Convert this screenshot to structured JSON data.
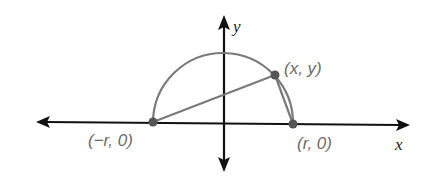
{
  "diagram": {
    "type": "semicircle-triangle",
    "axes": {
      "x_label": "x",
      "y_label": "y"
    },
    "points": [
      {
        "id": "left",
        "label": "(−r, 0)"
      },
      {
        "id": "top",
        "label": "(x, y)"
      },
      {
        "id": "right",
        "label": "(r, 0)"
      }
    ],
    "colors": {
      "axis": "#111111",
      "curve": "#7a7a7a",
      "label": "#6b6b6b"
    }
  }
}
